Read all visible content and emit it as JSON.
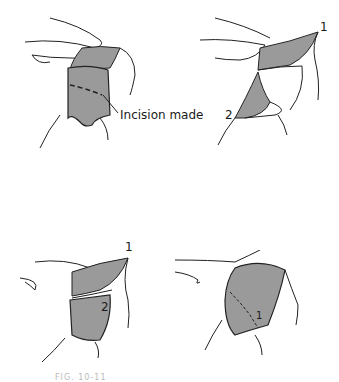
{
  "figure": {
    "panels": [
      {
        "id": "A",
        "description": "Shoulder with gray flap; dashed incision line",
        "labels": [
          "Incision made"
        ]
      },
      {
        "id": "B",
        "description": "Flap divided into two parts folded back",
        "labels": [
          "1",
          "2"
        ]
      },
      {
        "id": "C",
        "description": "Flap 1 folded up, flap 2 laid over",
        "labels": [
          "1",
          "2"
        ]
      },
      {
        "id": "D",
        "description": "Flaps sutured in place",
        "labels": [
          "1"
        ]
      }
    ],
    "caption": "FIG. 10-11"
  },
  "colors": {
    "flap": "#9a9a9a",
    "line": "#222222",
    "bg": "#ffffff"
  }
}
